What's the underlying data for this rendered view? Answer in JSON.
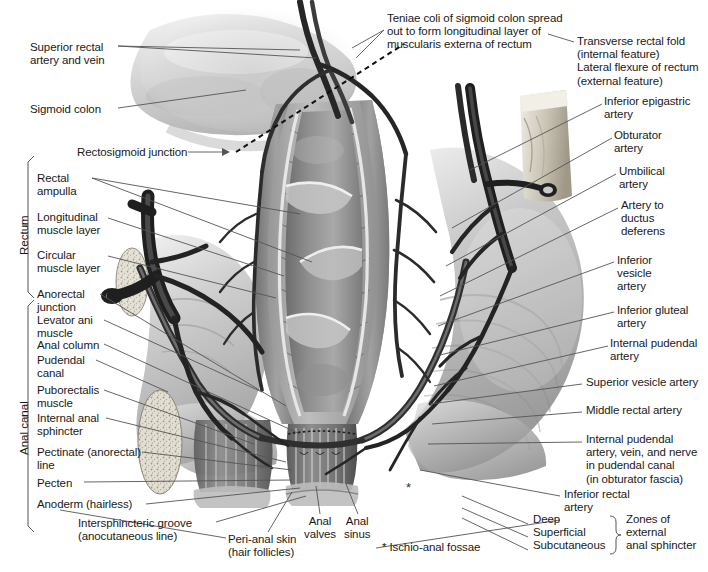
{
  "figure": {
    "footnote": "* Ischio-anal fossae"
  },
  "brackets": {
    "rectum": "Rectum",
    "anal_canal": "Anal canal",
    "zones": "Zones of\nexternal\nanal sphincter"
  },
  "labels_left": [
    {
      "id": "superior-rectal-artery-and-vein",
      "text": "Superior rectal\nartery and vein",
      "x": 30,
      "y": 41
    },
    {
      "id": "sigmoid-colon",
      "text": "Sigmoid colon",
      "x": 30,
      "y": 103
    },
    {
      "id": "rectosigmoid-junction",
      "text": "Rectosigmoid junction",
      "x": 77,
      "y": 148
    },
    {
      "id": "rectal-ampulla",
      "text": "Rectal\nampulla",
      "x": 37,
      "y": 175
    },
    {
      "id": "longitudinal-muscle-layer",
      "text": "Longitudinal\nmuscle layer",
      "x": 37,
      "y": 213
    },
    {
      "id": "circular-muscle-layer",
      "text": "Circular\nmuscle layer",
      "x": 37,
      "y": 251
    },
    {
      "id": "anorectal-junction",
      "text": "Anorectal\njunction",
      "x": 37,
      "y": 290
    },
    {
      "id": "levator-ani-muscle",
      "text": "Levator ani\nmuscle",
      "x": 37,
      "y": 316
    },
    {
      "id": "anal-column",
      "text": "Anal column",
      "x": 37,
      "y": 341
    },
    {
      "id": "pudendal-canal",
      "text": "Pudendal\ncanal",
      "x": 37,
      "y": 356
    },
    {
      "id": "puborectalis-muscle",
      "text": "Puborectalis\nmuscle",
      "x": 37,
      "y": 386
    },
    {
      "id": "internal-anal-sphincter",
      "text": "Internal anal\nsphincter",
      "x": 37,
      "y": 414
    },
    {
      "id": "pectinate-anorectal-line",
      "text": "Pectinate (anorectal)\nline",
      "x": 37,
      "y": 448
    },
    {
      "id": "pecten",
      "text": "Pecten",
      "x": 37,
      "y": 479
    },
    {
      "id": "anoderm-hairless",
      "text": "Anoderm (hairless)",
      "x": 37,
      "y": 500
    },
    {
      "id": "intersphincteric-groove",
      "text": "Intersphincteric groove\n(anocutaneous line)",
      "x": 78,
      "y": 519
    }
  ],
  "labels_top": [
    {
      "id": "teniae-coli",
      "text": "Teniae coli of sigmoid colon spread\nout to form longitudinal layer of\nmuscularis externa of rectum",
      "x": 387,
      "y": 13
    }
  ],
  "labels_right": [
    {
      "id": "transverse-rectal-fold",
      "text": "Transverse rectal fold\n(internal feature)\nLateral flexure of rectum\n(external feature)",
      "x": 577,
      "y": 37
    },
    {
      "id": "inferior-epigastric-artery",
      "text": "Inferior epigastric\nartery",
      "x": 604,
      "y": 97
    },
    {
      "id": "obturator-artery",
      "text": "Obturator\nartery",
      "x": 614,
      "y": 131
    },
    {
      "id": "umbilical-artery",
      "text": "Umbilical\nartery",
      "x": 619,
      "y": 167
    },
    {
      "id": "artery-to-ductus-deferens",
      "text": "Artery to\nductus\ndeferens",
      "x": 621,
      "y": 201
    },
    {
      "id": "inferior-vesicle-artery",
      "text": "Inferior\nvesicle\nartery",
      "x": 617,
      "y": 256
    },
    {
      "id": "inferior-gluteal-artery",
      "text": "Inferior gluteal\nartery",
      "x": 617,
      "y": 306
    },
    {
      "id": "internal-pudendal-artery",
      "text": "Internal pudendal\nartery",
      "x": 610,
      "y": 339
    },
    {
      "id": "superior-vesicle-artery",
      "text": "Superior vesicle artery",
      "x": 586,
      "y": 378
    },
    {
      "id": "middle-rectal-artery",
      "text": "Middle rectal artery",
      "x": 586,
      "y": 406
    },
    {
      "id": "internal-pudendal-artery-vein-nerve",
      "text": "Internal pudendal\nartery, vein, and nerve\nin pudendal canal\n(in obturator fascia)",
      "x": 586,
      "y": 435
    },
    {
      "id": "inferior-rectal-artery",
      "text": "Inferior rectal\nartery",
      "x": 564,
      "y": 490
    }
  ],
  "labels_bottom": [
    {
      "id": "peri-anal-skin",
      "text": "Peri-anal skin\n(hair follicles)",
      "x": 228,
      "y": 535
    },
    {
      "id": "anal-valves",
      "text": "Anal\nvalves",
      "x": 310,
      "y": 517
    },
    {
      "id": "anal-sinus",
      "text": "Anal\nsinus",
      "x": 348,
      "y": 517
    },
    {
      "id": "ischio-anal-fossae",
      "text": "* Ischio-anal fossae",
      "x": 382,
      "y": 543
    }
  ],
  "zones_items": [
    {
      "id": "zone-deep",
      "text": "Deep",
      "x": 533,
      "y": 520
    },
    {
      "id": "zone-superficial",
      "text": "Superficial",
      "x": 533,
      "y": 533
    },
    {
      "id": "zone-subcutaneous",
      "text": "Subcutaneous",
      "x": 533,
      "y": 546
    }
  ],
  "colors": {
    "text": "#1a1a1a",
    "leader": "#4a4a4a",
    "background": "#ffffff",
    "vessel_dark": "#2b2b2b",
    "tissue_mid": "#9a9a9a",
    "tissue_light": "#cfcfcf",
    "tissue_dark": "#6e6e6e",
    "bone": "#d9d4c8"
  }
}
